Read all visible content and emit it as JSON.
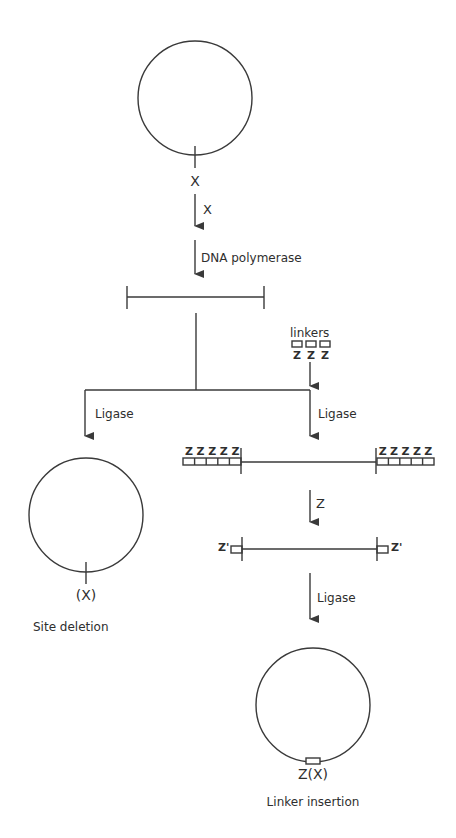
{
  "diagram": {
    "title": "",
    "colors": {
      "line": "#3a3a3a",
      "text": "#2e2e2e",
      "background": "#ffffff"
    },
    "top_plasmid": {
      "site_label": "X"
    },
    "steps": [
      {
        "id": "digest",
        "label": "X"
      },
      {
        "id": "fill_in",
        "label": "DNA polymerase"
      }
    ],
    "linkers": {
      "label": "linkers",
      "z_labels": [
        "Z",
        "Z",
        "Z"
      ]
    },
    "left_branch": {
      "step_label": "Ligase",
      "site_label": "(X)",
      "outcome": "Site deletion"
    },
    "right_branch": {
      "step_label": "Ligase",
      "linker_z_left": [
        "Z",
        "Z",
        "Z",
        "Z",
        "Z"
      ],
      "linker_z_right": [
        "Z",
        "Z",
        "Z",
        "Z",
        "Z"
      ],
      "digest_label": "Z",
      "end_label_left": "Z'",
      "end_label_right": "Z'",
      "ligate_label": "Ligase",
      "site_label": "Z(X)",
      "outcome": "Linker insertion"
    }
  }
}
